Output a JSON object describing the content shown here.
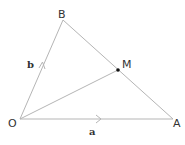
{
  "diagram": {
    "colors": {
      "line": "#b5b5b5",
      "text": "#333333",
      "point": "#111111",
      "background": "#ffffff"
    },
    "points": {
      "O": {
        "label": "O",
        "x": 20,
        "y": 119
      },
      "A": {
        "label": "A",
        "x": 173,
        "y": 119
      },
      "B": {
        "label": "B",
        "x": 63,
        "y": 20
      },
      "M": {
        "label": "M",
        "x": 118,
        "y": 70
      }
    },
    "segments": [
      {
        "from": "O",
        "to": "A",
        "vector_label": "a",
        "arrow": true
      },
      {
        "from": "O",
        "to": "B",
        "vector_label": "b",
        "arrow": true
      },
      {
        "from": "B",
        "to": "A",
        "arrow": false
      },
      {
        "from": "O",
        "to": "M",
        "arrow": false
      }
    ],
    "vector_labels": {
      "a": "a",
      "b": "b"
    },
    "point_labels": {
      "O": "O",
      "A": "A",
      "B": "B",
      "M": "M"
    }
  }
}
